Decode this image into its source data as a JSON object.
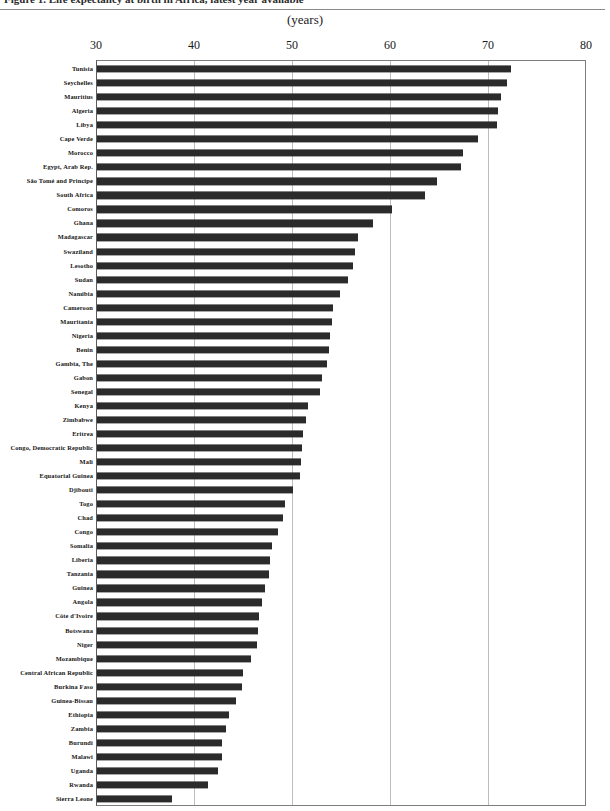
{
  "figure": {
    "title_clipped": "Figure 1.  Life expectancy at birth in Africa, latest year available",
    "units_label": "(years)"
  },
  "chart_data": {
    "type": "bar",
    "orientation": "horizontal",
    "title": "",
    "subtitle": "",
    "xlabel": "(years)",
    "ylabel": "",
    "xlim": [
      30,
      80
    ],
    "ticks": [
      30,
      40,
      50,
      60,
      70,
      80
    ],
    "grid": true,
    "legend": null,
    "bar_color": "#2b2b2b",
    "categories": [
      "Tunisia",
      "Seychelles",
      "Mauritius",
      "Algeria",
      "Libya",
      "Cape Verde",
      "Morocco",
      "Egypt, Arab Rep.",
      "São Tomé and Principe",
      "South Africa",
      "Comoros",
      "Ghana",
      "Madagascar",
      "Swaziland",
      "Lesotho",
      "Sudan",
      "Namibia",
      "Cameroon",
      "Mauritania",
      "Nigeria",
      "Benin",
      "Gambia, The",
      "Gabon",
      "Senegal",
      "Kenya",
      "Zimbabwe",
      "Eritrea",
      "Congo, Democratic  Republic",
      "Mali",
      "Equatorial Guinea",
      "Djibouti",
      "Togo",
      "Chad",
      "Congo",
      "Somalia",
      "Liberia",
      "Tanzania",
      "Guinea",
      "Angola",
      "Côte d'Ivoire",
      "Botswana",
      "Niger",
      "Mozambique",
      "Central African Republic",
      "Burkina Faso",
      "Guinea-Bissau",
      "Ethiopia",
      "Zambia",
      "Burundi",
      "Malawi",
      "Uganda",
      "Rwanda",
      "Sierra Leone"
    ],
    "values": [
      72.3,
      71.9,
      71.3,
      71.0,
      70.9,
      69.0,
      67.4,
      67.2,
      64.8,
      63.6,
      60.2,
      58.3,
      56.7,
      56.4,
      56.2,
      55.7,
      54.9,
      54.2,
      54.1,
      53.9,
      53.8,
      53.6,
      53.1,
      52.9,
      51.6,
      51.4,
      51.1,
      51.0,
      50.9,
      50.8,
      50.1,
      49.3,
      49.1,
      48.6,
      48.0,
      47.8,
      47.7,
      47.2,
      46.9,
      46.6,
      46.5,
      46.4,
      45.8,
      45.0,
      44.9,
      44.3,
      43.6,
      43.3,
      42.9,
      42.9,
      42.4,
      41.4,
      37.8
    ]
  }
}
